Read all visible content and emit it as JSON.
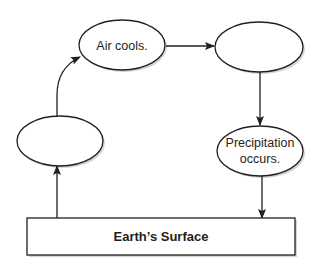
{
  "diagram": {
    "type": "cycle-flowchart",
    "nodes": [
      {
        "id": "air-cools",
        "shape": "ellipse",
        "lines": [
          "Air cools."
        ]
      },
      {
        "id": "blank-top-right",
        "shape": "ellipse",
        "lines": []
      },
      {
        "id": "precipitation",
        "shape": "ellipse",
        "lines": [
          "Precipitation",
          "occurs."
        ]
      },
      {
        "id": "blank-left",
        "shape": "ellipse",
        "lines": []
      },
      {
        "id": "earths-surface",
        "shape": "rectangle",
        "lines": [
          "Earth’s Surface"
        ]
      }
    ],
    "edges": [
      {
        "from": "blank-left",
        "to": "air-cools"
      },
      {
        "from": "air-cools",
        "to": "blank-top-right"
      },
      {
        "from": "blank-top-right",
        "to": "precipitation"
      },
      {
        "from": "precipitation",
        "to": "earths-surface"
      },
      {
        "from": "earths-surface",
        "to": "blank-left"
      }
    ],
    "colors": {
      "stroke": "#231f20",
      "fill": "#ffffff",
      "shadow": "#c8c8c8"
    }
  }
}
